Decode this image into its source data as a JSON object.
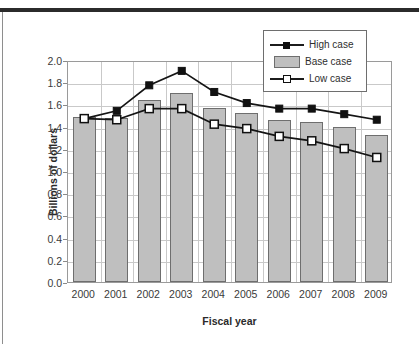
{
  "figure": {
    "y_axis_title": "Billions of dollars",
    "x_axis_title": "Fiscal year",
    "ghost_text": "-  -   - --  - -"
  },
  "legend": {
    "position": "top-right-inside",
    "items": [
      {
        "label": "High case",
        "marker": "filled-square",
        "style": "line",
        "color": "#101010"
      },
      {
        "label": "Base case",
        "marker": "bar",
        "style": "bar",
        "color": "#bfbfbf"
      },
      {
        "label": "Low case",
        "marker": "open-square",
        "style": "line",
        "color": "#101010"
      }
    ]
  },
  "chart_data": {
    "type": "bar",
    "title": "",
    "subtitle": "",
    "xlabel": "Fiscal year",
    "ylabel": "Billions of dollars",
    "ylim": [
      0.0,
      2.0
    ],
    "ytick_step": 0.2,
    "yticks": [
      "2.0",
      "1.8",
      "1.6",
      "1.4",
      "1.2",
      "1.0",
      "0.8",
      "0.6",
      "0.4",
      "0.2",
      "0.0"
    ],
    "grid": true,
    "grid_axis": "both",
    "legend": [
      "High case",
      "Base case",
      "Low case"
    ],
    "legend_position": "top-right",
    "categories": [
      "2000",
      "2001",
      "2002",
      "2003",
      "2004",
      "2005",
      "2006",
      "2007",
      "2008",
      "2009"
    ],
    "series": [
      {
        "name": "High case",
        "type": "line",
        "marker": "filled-square",
        "values": [
          1.49,
          1.56,
          1.79,
          1.92,
          1.73,
          1.63,
          1.58,
          1.58,
          1.53,
          1.48
        ]
      },
      {
        "name": "Base case",
        "type": "bar",
        "values": [
          1.49,
          1.48,
          1.64,
          1.7,
          1.57,
          1.52,
          1.46,
          1.44,
          1.4,
          1.32
        ]
      },
      {
        "name": "Low case",
        "type": "line",
        "marker": "open-square",
        "values": [
          1.49,
          1.48,
          1.58,
          1.58,
          1.44,
          1.4,
          1.33,
          1.29,
          1.22,
          1.14
        ]
      }
    ]
  }
}
